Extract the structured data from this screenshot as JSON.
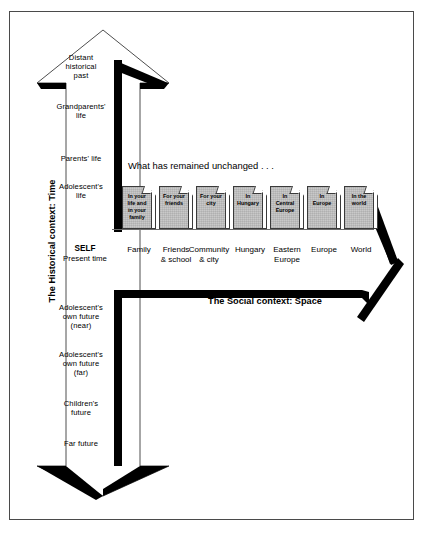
{
  "figure": {
    "headline": "What has remained unchanged . . .",
    "vertical_axis_title": "The Historical context: Time",
    "horizontal_axis_title": "The Social context: Space",
    "origin": {
      "primary": "SELF",
      "secondary": "Present time"
    }
  },
  "time_axis": {
    "past_labels": [
      {
        "text": "Distant\nhistorical\npast",
        "top": 54
      },
      {
        "text": "Grandparents'\nlife",
        "top": 103
      },
      {
        "text": "Parents' life",
        "top": 155
      },
      {
        "text": "Adolescent's\nlife",
        "top": 183
      }
    ],
    "future_labels": [
      {
        "text": "Adolescent's\nown future\n(near)",
        "top": 304
      },
      {
        "text": "Adolescent's\nown future\n(far)",
        "top": 351
      },
      {
        "text": "Children's\nfuture",
        "top": 400
      },
      {
        "text": "Far future",
        "top": 440
      }
    ]
  },
  "space_axis": {
    "boxes": [
      {
        "text": "In your\nlife and\nin your\nfamily",
        "left": 122
      },
      {
        "text": "For your\nfriends",
        "left": 159
      },
      {
        "text": "For your\ncity",
        "left": 196
      },
      {
        "text": "In\nHungary",
        "left": 233
      },
      {
        "text": "In\nCentral\nEurope",
        "left": 270
      },
      {
        "text": "In\nEurope",
        "left": 307
      },
      {
        "text": "In the\nworld",
        "left": 344
      }
    ],
    "columns": [
      {
        "text": "Family",
        "left": 116
      },
      {
        "text": "Friends\n& school",
        "left": 153
      },
      {
        "text": "Community\n& city",
        "left": 186
      },
      {
        "text": "Hungary",
        "left": 227
      },
      {
        "text": "Eastern\nEurope",
        "left": 264
      },
      {
        "text": "Europe",
        "left": 301
      },
      {
        "text": "World",
        "left": 338
      }
    ]
  },
  "colors": {
    "box_fill": "#c9c9c9",
    "stroke": "#000000",
    "frame": "#4a4a4a",
    "background": "#ffffff"
  }
}
